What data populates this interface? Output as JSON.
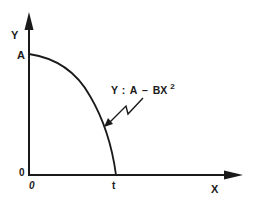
{
  "diagram": {
    "type": "graph",
    "y_axis_label": "Y",
    "x_axis_label": "X",
    "y_intercept_label": "A",
    "origin_y_label": "0",
    "origin_x_label": "0",
    "x_intercept_label": "t",
    "equation": {
      "lhs": "Y",
      "eq": ":",
      "rhs_a": "A",
      "minus": "–",
      "rhs_b": "BX",
      "exponent": "2"
    },
    "colors": {
      "ink": "#1a1a1a",
      "background": "#ffffff"
    }
  }
}
